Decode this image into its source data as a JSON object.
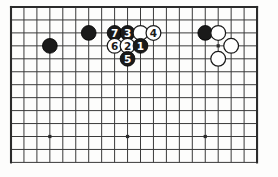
{
  "figure": {
    "kind": "go-board-diagram",
    "board": {
      "columns": 20,
      "rows": 13,
      "pitch": 12.95,
      "origin_x": 11,
      "origin_y": 7,
      "line_color": "#3a3a3a",
      "border_color": "#2b2b2b",
      "background_color": "#fdfdfc",
      "line_width": 1.0,
      "border_width": 2.1,
      "bottom_edge_open": true
    },
    "star_points": [
      {
        "name": "star-point-left",
        "col": 3,
        "row": 10
      },
      {
        "name": "star-point-center",
        "col": 9,
        "row": 10
      },
      {
        "name": "star-point-right",
        "col": 15,
        "row": 10
      },
      {
        "name": "star-point-upper-right",
        "col": 16,
        "row": 3
      }
    ],
    "stone_colors": {
      "black_fill": "#1a1a1a",
      "black_stroke": "#000000",
      "white_fill": "#ffffff",
      "white_stroke": "#1a1a1a",
      "black_label_color": "#ffffff",
      "white_label_color": "#1a1a1a"
    },
    "stone_radius": 7.4,
    "label_font_size": 10.5,
    "stones": [
      {
        "name": "black-stone-left-approach",
        "color": "black",
        "label": "",
        "col": 3,
        "row": 3
      },
      {
        "name": "black-stone-upper-left",
        "color": "black",
        "label": "",
        "col": 6,
        "row": 2
      },
      {
        "name": "black-move-7",
        "color": "black",
        "label": "7",
        "col": 8,
        "row": 2
      },
      {
        "name": "black-move-3",
        "color": "black",
        "label": "3",
        "col": 9,
        "row": 2
      },
      {
        "name": "white-stone-plain-top",
        "color": "white",
        "label": "",
        "col": 10,
        "row": 2
      },
      {
        "name": "white-move-4",
        "color": "white",
        "label": "4",
        "col": 11,
        "row": 2
      },
      {
        "name": "white-move-6",
        "color": "white",
        "label": "6",
        "col": 8,
        "row": 3
      },
      {
        "name": "white-move-2",
        "color": "white",
        "label": "2",
        "col": 9,
        "row": 3
      },
      {
        "name": "black-move-1",
        "color": "black",
        "label": "1",
        "col": 10,
        "row": 3
      },
      {
        "name": "black-move-5",
        "color": "black",
        "label": "5",
        "col": 9,
        "row": 4
      },
      {
        "name": "black-stone-upper-right",
        "color": "black",
        "label": "",
        "col": 15,
        "row": 2
      },
      {
        "name": "white-stone-upper-right-a",
        "color": "white",
        "label": "",
        "col": 16,
        "row": 2
      },
      {
        "name": "white-stone-upper-right-b",
        "color": "white",
        "label": "",
        "col": 17,
        "row": 3
      },
      {
        "name": "white-stone-upper-right-c",
        "color": "white",
        "label": "",
        "col": 16,
        "row": 4
      }
    ],
    "move_sequence": [
      {
        "move": "1",
        "color": "black"
      },
      {
        "move": "2",
        "color": "white"
      },
      {
        "move": "3",
        "color": "black"
      },
      {
        "move": "4",
        "color": "white"
      },
      {
        "move": "5",
        "color": "black"
      },
      {
        "move": "6",
        "color": "white"
      },
      {
        "move": "7",
        "color": "black"
      }
    ]
  }
}
